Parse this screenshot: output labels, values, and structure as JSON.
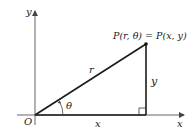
{
  "diagram": {
    "title": "",
    "axes": {
      "x_label": "x",
      "y_label": "y",
      "origin_label": "O"
    },
    "point_label": "P(r, θ) = P(x, y)",
    "hypotenuse_label": "r",
    "vertical_leg_label": "y",
    "horizontal_leg_label": "x",
    "angle_label": "θ",
    "colors": {
      "line": "#1a1a1a",
      "axis": "#555555",
      "background": "#ffffff"
    }
  }
}
